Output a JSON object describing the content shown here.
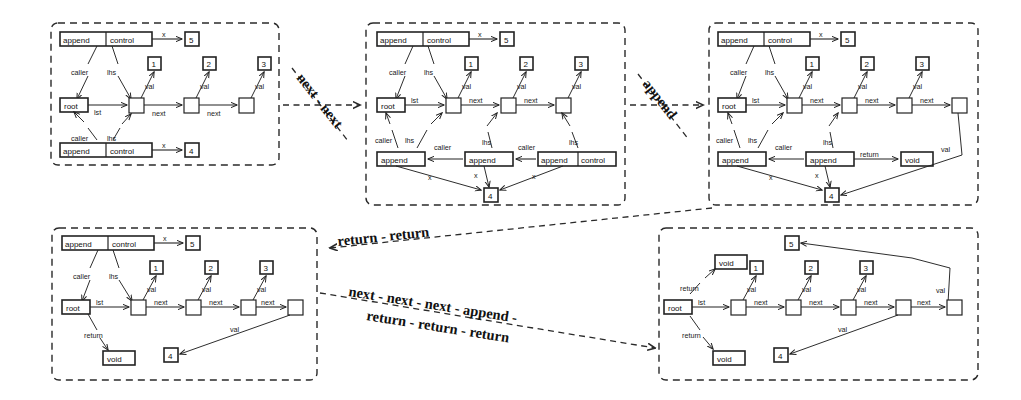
{
  "figure": {
    "background_color": "#ffffff",
    "ink_color": "#1a1a1a",
    "panel_border": "dashed"
  },
  "glyphs": {
    "append": "append",
    "control": "control",
    "append_control": "append | control",
    "root": "root",
    "void": "void",
    "caller": "caller",
    "lhs": "lhs",
    "lst": "lst",
    "next": "next",
    "val": "val",
    "x": "x",
    "return": "return",
    "n1": "1",
    "n2": "2",
    "n3": "3",
    "n4": "4",
    "n5": "5"
  },
  "transitions": [
    {
      "id": "t1",
      "label": "next - next",
      "from_panel": "panel-1",
      "to_panel": "panel-2"
    },
    {
      "id": "t2",
      "label": "append",
      "from_panel": "panel-2",
      "to_panel": "panel-3"
    },
    {
      "id": "t3",
      "label": "return - return",
      "from_panel": "panel-3",
      "to_panel": "panel-4"
    },
    {
      "id": "t4",
      "label": "next - next - next - append -",
      "label2": "return - return - return",
      "from_panel": "panel-4",
      "to_panel": "panel-5"
    }
  ],
  "panels": [
    {
      "id": "panel-1",
      "name": "initial-state",
      "frames": [
        {
          "label": "append | control",
          "arg_label": "x",
          "arg_value": "5"
        },
        {
          "label": "append | control",
          "arg_label": "x",
          "arg_value": "4"
        }
      ],
      "root": "root",
      "root_edge": "lst",
      "list_nodes": 3,
      "values": [
        "1",
        "2",
        "3"
      ],
      "value_edge": "val",
      "link_edge": "next",
      "frame_edges": [
        "caller",
        "lhs"
      ]
    },
    {
      "id": "panel-2",
      "name": "after-next-next",
      "frames_top": [
        {
          "label": "append | control",
          "arg_label": "x",
          "arg_value": "5"
        }
      ],
      "frames_bottom": [
        {
          "label": "append"
        },
        {
          "label": "append"
        },
        {
          "label": "append | control"
        }
      ],
      "root": "root",
      "root_edge": "lst",
      "list_nodes": 3,
      "values": [
        "1",
        "2",
        "3"
      ],
      "value_edge": "val",
      "link_edge": "next",
      "arg_value": "4",
      "arg_label": "x",
      "caller_edge": "caller",
      "lhs_edge": "lhs"
    },
    {
      "id": "panel-3",
      "name": "after-append",
      "frames_top": [
        {
          "label": "append | control",
          "arg_label": "x",
          "arg_value": "5"
        }
      ],
      "frames_bottom": [
        {
          "label": "append"
        },
        {
          "label": "append"
        }
      ],
      "root": "root",
      "root_edge": "lst",
      "list_nodes": 4,
      "values": [
        "1",
        "2",
        "3"
      ],
      "value_edge": "val",
      "link_edge": "next",
      "return_edge": "return",
      "return_value": "void",
      "arg_value": "4",
      "arg_label": "x",
      "caller_edge": "caller",
      "lhs_edge": "lhs"
    },
    {
      "id": "panel-4",
      "name": "after-return-return",
      "frames_top": [
        {
          "label": "append | control",
          "arg_label": "x",
          "arg_value": "5"
        }
      ],
      "root": "root",
      "root_edge": "lst",
      "list_nodes": 4,
      "values": [
        "1",
        "2",
        "3"
      ],
      "value_edge": "val",
      "link_edge": "next",
      "return_edge": "return",
      "return_value": "void",
      "tail_value": "4",
      "caller_edge": "caller"
    },
    {
      "id": "panel-5",
      "name": "final-state",
      "root": "root",
      "root_edge": "lst",
      "list_nodes": 5,
      "values": [
        "1",
        "2",
        "3"
      ],
      "value_edge": "val",
      "link_edge": "next",
      "return_edge": "return",
      "return_value": "void",
      "tail_values": [
        "4",
        "5"
      ]
    }
  ]
}
